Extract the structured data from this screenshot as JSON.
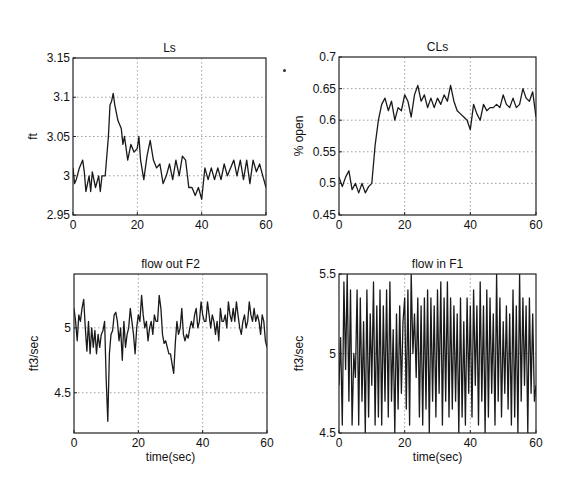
{
  "figure": {
    "width": 571,
    "height": 493,
    "line_color": "#1a1a1a",
    "grid_color": "#888888"
  },
  "chart_data": [
    {
      "type": "line",
      "title": "Ls",
      "xlabel": "",
      "ylabel": "ft",
      "xlim": [
        0,
        60
      ],
      "ylim": [
        2.95,
        3.15
      ],
      "xticks": [
        0,
        20,
        40,
        60
      ],
      "yticks": [
        2.95,
        3,
        3.05,
        3.1,
        3.15
      ],
      "ytick_labels": [
        "2.95",
        "3",
        "3.05",
        "3.1",
        "3.15"
      ],
      "grid": true,
      "box": {
        "left": 73,
        "top": 58,
        "right": 266,
        "bottom": 215
      },
      "series": [
        {
          "name": "Ls",
          "x": [
            0,
            0.5,
            1,
            2,
            3,
            3.5,
            4,
            5,
            5.5,
            6,
            7,
            8,
            8.5,
            9,
            10,
            11,
            11.5,
            12,
            12.5,
            13,
            14,
            15,
            15.5,
            16,
            17,
            18,
            19,
            20,
            20.5,
            21,
            22,
            23,
            24,
            25,
            26,
            27,
            28,
            29,
            30,
            31,
            32,
            33,
            34,
            35,
            36,
            37,
            38,
            39,
            40,
            41,
            42,
            43,
            44,
            45,
            46,
            47,
            48,
            49,
            50,
            51,
            52,
            53,
            54,
            55,
            56,
            57,
            58,
            59,
            60
          ],
          "y": [
            3.01,
            2.99,
            2.995,
            3.01,
            3.02,
            3.005,
            2.98,
            3.0,
            2.98,
            3.005,
            2.985,
            3.0,
            2.98,
            3.0,
            3.0,
            3.05,
            3.09,
            3.095,
            3.105,
            3.09,
            3.07,
            3.06,
            3.04,
            3.05,
            3.02,
            3.04,
            3.03,
            3.035,
            3.05,
            3.02,
            2.995,
            3.025,
            3.045,
            3.02,
            3.01,
            3.015,
            2.99,
            3.0,
            3.015,
            2.995,
            3.02,
            3.0,
            3.025,
            3.02,
            2.985,
            2.985,
            2.975,
            2.985,
            2.97,
            3.01,
            2.995,
            3.01,
            2.995,
            3.01,
            2.995,
            3.015,
            3.0,
            3.01,
            3.02,
            3.0,
            3.02,
            2.995,
            3.02,
            2.99,
            3.02,
            3.005,
            3.015,
            3.0,
            2.985
          ]
        }
      ]
    },
    {
      "type": "line",
      "title": "CLs",
      "xlabel": "",
      "ylabel": "% open",
      "xlim": [
        0,
        60
      ],
      "ylim": [
        0.45,
        0.7
      ],
      "xticks": [
        0,
        20,
        40,
        60
      ],
      "yticks": [
        0.45,
        0.5,
        0.55,
        0.6,
        0.65,
        0.7
      ],
      "ytick_labels": [
        "0.45",
        "0.5",
        "0.55",
        "0.6",
        "0.65",
        "0.7"
      ],
      "grid": true,
      "box": {
        "left": 339,
        "top": 57,
        "right": 536,
        "bottom": 215
      },
      "series": [
        {
          "name": "CLs",
          "x": [
            0,
            1,
            2,
            3,
            4,
            5,
            6,
            7,
            8,
            9,
            10,
            11,
            12,
            13,
            14,
            15,
            16,
            17,
            18,
            19,
            20,
            21,
            22,
            23,
            24,
            25,
            26,
            27,
            28,
            29,
            30,
            31,
            32,
            33,
            34,
            35,
            36,
            37,
            38,
            39,
            40,
            41,
            42,
            43,
            44,
            45,
            46,
            47,
            48,
            49,
            50,
            51,
            52,
            53,
            54,
            55,
            56,
            57,
            58,
            59,
            60
          ],
          "y": [
            0.51,
            0.495,
            0.51,
            0.52,
            0.49,
            0.5,
            0.485,
            0.5,
            0.485,
            0.495,
            0.5,
            0.56,
            0.6,
            0.625,
            0.635,
            0.615,
            0.63,
            0.6,
            0.62,
            0.615,
            0.64,
            0.63,
            0.605,
            0.64,
            0.655,
            0.63,
            0.64,
            0.62,
            0.635,
            0.62,
            0.635,
            0.625,
            0.64,
            0.63,
            0.655,
            0.63,
            0.615,
            0.61,
            0.605,
            0.6,
            0.585,
            0.625,
            0.61,
            0.6,
            0.625,
            0.615,
            0.62,
            0.62,
            0.625,
            0.62,
            0.64,
            0.625,
            0.62,
            0.635,
            0.62,
            0.625,
            0.65,
            0.635,
            0.63,
            0.645,
            0.605
          ]
        }
      ]
    },
    {
      "type": "line",
      "title": "flow out F2",
      "xlabel": "time(sec)",
      "ylabel": "ft3/sec",
      "xlim": [
        0,
        60
      ],
      "ylim": [
        4.19,
        5.415
      ],
      "xticks": [
        0,
        20,
        40,
        60
      ],
      "yticks": [
        4.5,
        5
      ],
      "ytick_labels": [
        "4.5",
        "5"
      ],
      "grid": true,
      "box": {
        "left": 74,
        "top": 274,
        "right": 267,
        "bottom": 433
      },
      "series": [
        {
          "name": "flow out F2",
          "x": [
            0,
            0.5,
            1,
            1.5,
            2,
            2.5,
            3,
            3.5,
            4,
            4.5,
            5,
            5.5,
            6,
            6.5,
            7,
            7.5,
            8,
            8.5,
            9,
            9.5,
            10,
            10.5,
            11,
            11.5,
            12,
            12.5,
            13,
            13.5,
            14,
            14.5,
            15,
            15.5,
            16,
            16.5,
            17,
            17.5,
            18,
            18.5,
            19,
            19.5,
            20,
            20.5,
            21,
            21.5,
            22,
            22.5,
            23,
            23.5,
            24,
            24.5,
            25,
            25.5,
            26,
            26.5,
            27,
            27.5,
            28,
            28.5,
            29,
            29.5,
            30,
            30.5,
            31,
            31.5,
            32,
            32.5,
            33,
            33.5,
            34,
            34.5,
            35,
            35.5,
            36,
            36.5,
            37,
            37.5,
            38,
            38.5,
            39,
            39.5,
            40,
            40.5,
            41,
            41.5,
            42,
            42.5,
            43,
            43.5,
            44,
            44.5,
            45,
            45.5,
            46,
            46.5,
            47,
            47.5,
            48,
            48.5,
            49,
            49.5,
            50,
            50.5,
            51,
            51.5,
            52,
            52.5,
            53,
            53.5,
            54,
            54.5,
            55,
            55.5,
            56,
            56.5,
            57,
            57.5,
            58,
            58.5,
            59,
            59.5,
            60
          ],
          "y": [
            5.15,
            5.05,
            4.9,
            5.1,
            5.05,
            5.15,
            5.22,
            5.0,
            4.82,
            5.05,
            4.8,
            5.0,
            4.85,
            4.98,
            4.8,
            4.95,
            4.85,
            4.95,
            4.98,
            5.05,
            4.6,
            4.28,
            4.8,
            4.95,
            4.98,
            5.1,
            5.12,
            5.05,
            4.9,
            5.0,
            4.75,
            5.05,
            4.85,
            4.95,
            5.0,
            5.15,
            5.05,
            4.95,
            4.8,
            5.0,
            5.1,
            5.05,
            5.25,
            5.1,
            5.0,
            5.05,
            4.9,
            5.0,
            5.05,
            4.95,
            5.1,
            5.05,
            5.05,
            5.25,
            5.15,
            4.95,
            4.88,
            4.9,
            4.85,
            4.8,
            4.8,
            4.72,
            4.65,
            4.88,
            5.05,
            4.95,
            5.0,
            5.15,
            4.95,
            4.9,
            4.95,
            4.92,
            5.0,
            5.05,
            5.0,
            5.1,
            5.15,
            5.0,
            5.05,
            5.2,
            5.1,
            5.05,
            5.05,
            5.2,
            5.1,
            5.0,
            5.1,
            5.05,
            4.95,
            5.05,
            4.9,
            5.15,
            5.05,
            5.05,
            5.1,
            5.0,
            5.2,
            5.1,
            5.05,
            5.15,
            5.05,
            5.2,
            5.1,
            5.0,
            4.95,
            5.05,
            5.1,
            5.0,
            5.05,
            5.2,
            5.1,
            5.05,
            5.15,
            5.05,
            5.1,
            5.05,
            4.95,
            5.1,
            5.05,
            4.9,
            4.85
          ]
        }
      ]
    },
    {
      "type": "line",
      "title": "flow in F1",
      "xlabel": "time(sec)",
      "ylabel": "ft3/sec",
      "xlim": [
        0,
        60
      ],
      "ylim": [
        4.5,
        5.5
      ],
      "xticks": [
        0,
        20,
        40,
        60
      ],
      "yticks": [
        4.5,
        5,
        5.5
      ],
      "ytick_labels": [
        "4.5",
        "5",
        "5.5"
      ],
      "grid": true,
      "box": {
        "left": 339,
        "top": 274,
        "right": 536,
        "bottom": 433
      },
      "series": [
        {
          "name": "flow in F1",
          "x": [
            0,
            0.5,
            1,
            1.5,
            2,
            2.5,
            3,
            3.5,
            4,
            4.5,
            5,
            5.5,
            6,
            6.5,
            7,
            7.5,
            8,
            8.5,
            9,
            9.5,
            10,
            10.5,
            11,
            11.5,
            12,
            12.5,
            13,
            13.5,
            14,
            14.5,
            15,
            15.5,
            16,
            16.5,
            17,
            17.5,
            18,
            18.5,
            19,
            19.5,
            20,
            20.5,
            21,
            21.5,
            22,
            22.5,
            23,
            23.5,
            24,
            24.5,
            25,
            25.5,
            26,
            26.5,
            27,
            27.5,
            28,
            28.5,
            29,
            29.5,
            30,
            30.5,
            31,
            31.5,
            32,
            32.5,
            33,
            33.5,
            34,
            34.5,
            35,
            35.5,
            36,
            36.5,
            37,
            37.5,
            38,
            38.5,
            39,
            39.5,
            40,
            40.5,
            41,
            41.5,
            42,
            42.5,
            43,
            43.5,
            44,
            44.5,
            45,
            45.5,
            46,
            46.5,
            47,
            47.5,
            48,
            48.5,
            49,
            49.5,
            50,
            50.5,
            51,
            51.5,
            52,
            52.5,
            53,
            53.5,
            54,
            54.5,
            55,
            55.5,
            56,
            56.5,
            57,
            57.5,
            58,
            58.5,
            59,
            59.5,
            60
          ],
          "y": [
            4.8,
            5.1,
            4.55,
            5.45,
            4.9,
            5.5,
            4.7,
            5.4,
            4.55,
            5.0,
            4.85,
            5.4,
            4.55,
            5.35,
            4.7,
            5.2,
            4.5,
            5.4,
            4.6,
            5.25,
            4.8,
            5.45,
            4.55,
            5.3,
            4.6,
            5.4,
            4.55,
            5.3,
            4.7,
            5.4,
            4.6,
            5.45,
            4.7,
            5.15,
            4.5,
            5.25,
            4.65,
            5.3,
            4.75,
            5.2,
            5.35,
            4.65,
            5.4,
            4.55,
            5.5,
            5.0,
            5.25,
            4.85,
            5.35,
            4.6,
            5.3,
            4.55,
            5.35,
            4.65,
            5.4,
            4.5,
            5.35,
            4.7,
            5.3,
            4.6,
            5.4,
            4.75,
            5.45,
            4.55,
            5.35,
            4.7,
            5.45,
            4.6,
            5.35,
            4.65,
            5.3,
            4.7,
            5.25,
            4.5,
            5.35,
            4.6,
            5.2,
            4.55,
            5.35,
            4.75,
            5.3,
            4.6,
            5.4,
            4.8,
            5.3,
            4.55,
            5.45,
            4.7,
            5.3,
            4.5,
            5.4,
            4.6,
            5.35,
            4.75,
            5.25,
            4.55,
            5.5,
            4.7,
            5.35,
            4.6,
            5.2,
            4.75,
            5.3,
            4.65,
            5.25,
            4.55,
            5.4,
            4.6,
            5.3,
            4.5,
            5.5,
            4.7,
            5.35,
            4.8,
            5.3,
            4.5,
            5.35,
            4.75,
            5.25,
            4.7,
            4.8
          ]
        }
      ]
    }
  ]
}
